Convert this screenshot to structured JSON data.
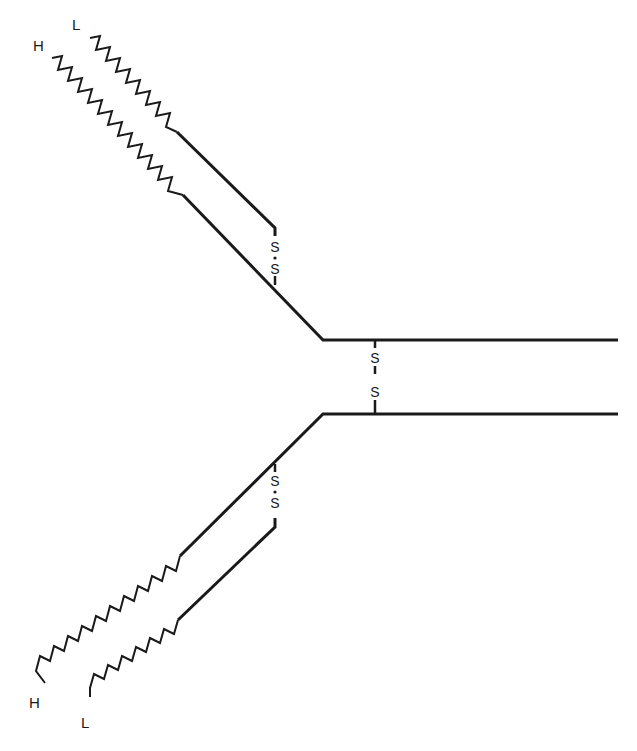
{
  "diagram": {
    "type": "antibody-structure",
    "upper_arm": {
      "heavy_label": "H",
      "light_label": "L",
      "interchain_bond": {
        "top": "S",
        "bottom": "S"
      }
    },
    "lower_arm": {
      "heavy_label": "H",
      "light_label": "L",
      "interchain_bond": {
        "top": "S",
        "bottom": "S"
      }
    },
    "hinge_bond": {
      "top": "S",
      "bottom": "S"
    },
    "colors": {
      "line": "#1a1a1a",
      "background": "#ffffff"
    }
  }
}
